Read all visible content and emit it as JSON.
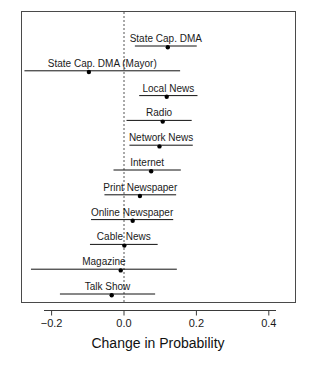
{
  "chart_data": {
    "type": "scatter",
    "title": "",
    "subtitle": "",
    "xlabel": "Change in Probability",
    "ylabel": "",
    "xlim": [
      -0.285,
      0.4757
    ],
    "xticks": [
      -0.2,
      0.0,
      0.2,
      0.4
    ],
    "xticklabels": [
      "-0.2",
      "0.0",
      "0.2",
      "0.4"
    ],
    "grid": false,
    "legend": null,
    "reference_line": 0.0,
    "reference_line_style": "dashed",
    "orientation": "horizontal-ci",
    "categories": [
      "State Cap. DMA",
      "State Cap. DMA (Mayor)",
      "Local News",
      "Radio",
      "Network News",
      "Internet",
      "Print Newspaper",
      "Online Newspaper",
      "Cable News",
      "Magazine",
      "Talk Show"
    ],
    "points": [
      {
        "label": "State Cap. DMA",
        "estimate": 0.121,
        "ci_low": 0.03,
        "ci_high": 0.201
      },
      {
        "label": "State Cap. DMA (Mayor)",
        "estimate": -0.097,
        "ci_low": -0.275,
        "ci_high": 0.155
      },
      {
        "label": "Local News",
        "estimate": 0.118,
        "ci_low": 0.042,
        "ci_high": 0.203
      },
      {
        "label": "Radio",
        "estimate": 0.107,
        "ci_low": 0.007,
        "ci_high": 0.187
      },
      {
        "label": "Network News",
        "estimate": 0.098,
        "ci_low": 0.015,
        "ci_high": 0.19
      },
      {
        "label": "Internet",
        "estimate": 0.075,
        "ci_low": -0.029,
        "ci_high": 0.157
      },
      {
        "label": "Print Newspaper",
        "estimate": 0.044,
        "ci_low": -0.054,
        "ci_high": 0.144
      },
      {
        "label": "Online Newspaper",
        "estimate": 0.024,
        "ci_low": -0.091,
        "ci_high": 0.136
      },
      {
        "label": "Cable News",
        "estimate": 0.001,
        "ci_low": -0.094,
        "ci_high": 0.093
      },
      {
        "label": "Magazine",
        "estimate": -0.009,
        "ci_low": -0.257,
        "ci_high": 0.146
      },
      {
        "label": "Talk Show",
        "estimate": -0.034,
        "ci_low": -0.177,
        "ci_high": 0.086
      }
    ]
  },
  "colors": {
    "point": "#000000",
    "line": "#111111",
    "axis": "#3a3a3a",
    "reference": "#555555",
    "background": "#ffffff"
  }
}
